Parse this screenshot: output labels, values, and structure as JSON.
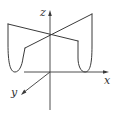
{
  "figure": {
    "axes": {
      "x_label": "x",
      "y_label": "y",
      "z_label": "z"
    },
    "colors": {
      "line": "#3a3a3a",
      "background": "#ffffff"
    }
  }
}
